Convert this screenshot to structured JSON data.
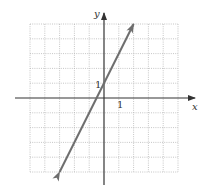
{
  "chart_data": {
    "type": "line",
    "title": "",
    "xlabel": "x",
    "ylabel": "y",
    "xlim": [
      -5,
      5
    ],
    "ylim": [
      -5,
      5
    ],
    "grid": true,
    "grid_style": "dotted",
    "x_tick_labels": [
      {
        "value": 1,
        "label": "1"
      }
    ],
    "y_tick_labels": [
      {
        "value": 1,
        "label": "1"
      }
    ],
    "series": [
      {
        "name": "y = 2x + 1",
        "equation": "y = 2x + 1",
        "slope": 2,
        "intercept": 1,
        "x": [
          -3,
          2
        ],
        "y": [
          -5,
          5
        ],
        "arrows": "both",
        "color": "#6e6e6e"
      }
    ],
    "legend": null
  },
  "colors": {
    "line": "#6e6e6e",
    "axis": "#333333",
    "grid": "#b8b8b8"
  },
  "labels": {
    "x_axis": "x",
    "y_axis": "y",
    "x_tick": "1",
    "y_tick": "1"
  }
}
